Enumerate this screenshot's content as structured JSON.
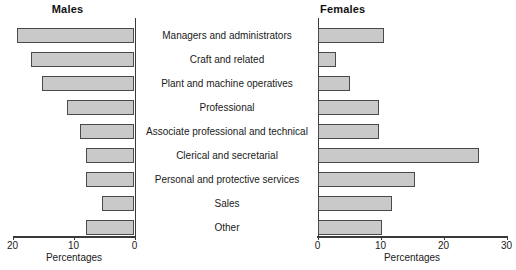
{
  "chart_data": {
    "type": "bar",
    "orientation": "horizontal",
    "layout": "back-to-back pyramid (two mirrored panels sharing category labels)",
    "grid": false,
    "legend_position": "none",
    "categories": [
      "Managers and administrators",
      "Craft and related",
      "Plant and machine operatives",
      "Professional",
      "Associate professional and technical",
      "Clerical and secretarial",
      "Personal and protective services",
      "Sales",
      "Other"
    ],
    "series": [
      {
        "name": "Males",
        "values": [
          19.2,
          17.0,
          15.2,
          11.0,
          9.0,
          8.0,
          8.0,
          5.4,
          8.0
        ],
        "xlabel": "Percentages",
        "xlim": [
          20,
          0
        ],
        "ticks": [
          20,
          10,
          0
        ],
        "tick_labels": [
          "20",
          "10",
          "0"
        ],
        "axis_direction": "reversed"
      },
      {
        "name": "Females",
        "values": [
          10.6,
          2.9,
          5.1,
          9.8,
          9.8,
          25.7,
          15.4,
          11.9,
          10.3
        ],
        "xlabel": "Percentages",
        "xlim": [
          0,
          30
        ],
        "ticks": [
          0,
          10,
          20,
          30
        ],
        "tick_labels": [
          "0",
          "10",
          "20",
          "30"
        ],
        "axis_direction": "normal"
      }
    ],
    "title": "",
    "xlabel": "Percentages",
    "ylabel": "",
    "bar_fill_color": "#c9c9c9",
    "bar_border_color": "#4a4a4a",
    "axis_color": "#3a3a3a"
  },
  "panels": {
    "males": {
      "title": "Males",
      "axis_caption": "Percentages"
    },
    "females": {
      "title": "Females",
      "axis_caption": "Percentages"
    }
  }
}
